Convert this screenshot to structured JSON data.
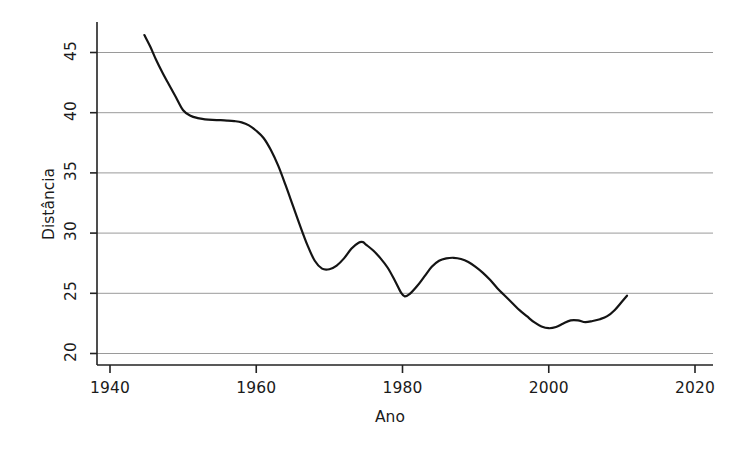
{
  "chart_data": {
    "type": "line",
    "title": "",
    "xlabel": "Ano",
    "ylabel": "Distância",
    "xlim": [
      1940,
      2020
    ],
    "ylim": [
      20,
      46.8
    ],
    "grid": true,
    "legend": null,
    "xticks": [
      1940,
      1960,
      1980,
      2000,
      2020
    ],
    "yticks": [
      20,
      25,
      30,
      35,
      40,
      45
    ],
    "gridlines_y": [
      20,
      25,
      30,
      35,
      40,
      45
    ],
    "line_color": "#141414",
    "grid_color": "#9a9a9a",
    "axis_color": "#222222",
    "series": [
      {
        "name": "Distância",
        "x": [
          1944.7,
          1945.5,
          1946.3,
          1947.2,
          1948.0,
          1949.0,
          1950.0,
          1951.0,
          1952.0,
          1953.0,
          1954.0,
          1955.0,
          1956.0,
          1957.0,
          1958.0,
          1959.0,
          1960.0,
          1961.0,
          1962.0,
          1963.0,
          1964.0,
          1965.0,
          1966.0,
          1967.0,
          1968.0,
          1969.0,
          1970.0,
          1971.0,
          1972.0,
          1973.0,
          1974.0,
          1974.6,
          1975.0,
          1976.0,
          1977.0,
          1978.0,
          1979.0,
          1979.8,
          1980.3,
          1981.0,
          1982.0,
          1983.0,
          1984.0,
          1985.0,
          1986.0,
          1987.0,
          1988.0,
          1989.0,
          1990.0,
          1991.0,
          1992.0,
          1993.0,
          1994.0,
          1995.0,
          1996.0,
          1997.0,
          1998.0,
          1999.0,
          2000.0,
          2001.0,
          2002.0,
          2003.0,
          2004.0,
          2005.0,
          2006.0,
          2007.0,
          2008.0,
          2009.0,
          2010.0,
          2010.7
        ],
        "y": [
          46.45,
          45.5,
          44.4,
          43.3,
          42.4,
          41.3,
          40.2,
          39.75,
          39.55,
          39.45,
          39.4,
          39.38,
          39.35,
          39.3,
          39.2,
          38.95,
          38.5,
          37.9,
          36.9,
          35.6,
          34.0,
          32.3,
          30.6,
          29.0,
          27.7,
          27.05,
          27.0,
          27.3,
          27.9,
          28.7,
          29.2,
          29.25,
          29.05,
          28.55,
          27.9,
          27.1,
          26.0,
          25.05,
          24.75,
          24.95,
          25.6,
          26.4,
          27.2,
          27.7,
          27.9,
          27.95,
          27.85,
          27.6,
          27.2,
          26.7,
          26.1,
          25.4,
          24.8,
          24.2,
          23.6,
          23.1,
          22.6,
          22.25,
          22.1,
          22.2,
          22.5,
          22.75,
          22.75,
          22.6,
          22.7,
          22.85,
          23.1,
          23.6,
          24.3,
          24.8
        ]
      }
    ]
  },
  "axes": {
    "y_title": "Distância",
    "x_title": "Ano",
    "y_tick_labels": [
      "20",
      "25",
      "30",
      "35",
      "40",
      "45"
    ],
    "x_tick_labels": [
      "1940",
      "1960",
      "1980",
      "2000",
      "2020"
    ]
  }
}
